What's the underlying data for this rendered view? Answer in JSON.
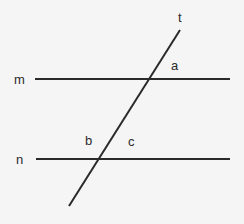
{
  "diagram": {
    "title": "",
    "type": "parallel lines cut by a transversal",
    "lines": [
      {
        "id": "m",
        "label": "m",
        "kind": "parallel",
        "x1": 35,
        "y1": 79,
        "x2": 230,
        "y2": 79
      },
      {
        "id": "n",
        "label": "n",
        "kind": "parallel",
        "x1": 36,
        "y1": 159,
        "x2": 230,
        "y2": 159
      },
      {
        "id": "t",
        "label": "t",
        "kind": "transversal",
        "x1": 180,
        "y1": 30,
        "x2": 69,
        "y2": 206
      }
    ],
    "labels": {
      "m": "m",
      "n": "n",
      "t": "t",
      "a": "a",
      "b": "b",
      "c": "c"
    },
    "angles": [
      {
        "name": "a",
        "at_line": "m",
        "position": "upper-right"
      },
      {
        "name": "b",
        "at_line": "n",
        "position": "upper-left"
      },
      {
        "name": "c",
        "at_line": "n",
        "position": "upper-right"
      }
    ],
    "colors": {
      "line": "#2a2a2a",
      "background": "#f5f5f5"
    }
  }
}
